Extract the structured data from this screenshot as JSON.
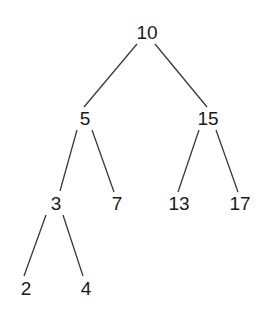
{
  "diagram": {
    "type": "binary-search-tree",
    "nodes": [
      {
        "id": "n10",
        "label": "10",
        "x": 147,
        "y": 32
      },
      {
        "id": "n5",
        "label": "5",
        "x": 85,
        "y": 118
      },
      {
        "id": "n15",
        "label": "15",
        "x": 208,
        "y": 118
      },
      {
        "id": "n3",
        "label": "3",
        "x": 56,
        "y": 203
      },
      {
        "id": "n7",
        "label": "7",
        "x": 117,
        "y": 203
      },
      {
        "id": "n13",
        "label": "13",
        "x": 179,
        "y": 203
      },
      {
        "id": "n17",
        "label": "17",
        "x": 240,
        "y": 203
      },
      {
        "id": "n2",
        "label": "2",
        "x": 26,
        "y": 288
      },
      {
        "id": "n4",
        "label": "4",
        "x": 86,
        "y": 288
      }
    ],
    "edges": [
      {
        "from": "10",
        "to": "5"
      },
      {
        "from": "10",
        "to": "15"
      },
      {
        "from": "5",
        "to": "3"
      },
      {
        "from": "5",
        "to": "7"
      },
      {
        "from": "15",
        "to": "13"
      },
      {
        "from": "15",
        "to": "17"
      },
      {
        "from": "3",
        "to": "2"
      },
      {
        "from": "3",
        "to": "4"
      }
    ],
    "colors": {
      "line": "#3a3a3a",
      "text": "#1a1a1a",
      "background": "#ffffff"
    }
  }
}
